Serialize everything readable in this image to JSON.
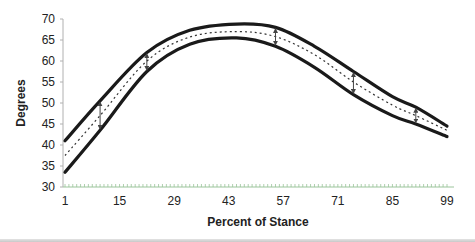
{
  "chart_data": {
    "type": "line",
    "title": "",
    "xlabel": "Percent of Stance",
    "ylabel": "Degrees",
    "xlim": [
      1,
      99
    ],
    "ylim": [
      30,
      70
    ],
    "xticks": [
      1,
      15,
      29,
      43,
      57,
      71,
      85,
      99
    ],
    "yticks": [
      30,
      35,
      40,
      45,
      50,
      55,
      60,
      65,
      70
    ],
    "grid": false,
    "legend": null,
    "x": [
      1,
      10,
      22,
      33,
      45,
      55,
      65,
      75,
      85,
      91,
      99
    ],
    "series": [
      {
        "name": "Upper bound",
        "style": "solid-thick",
        "values": [
          41.0,
          50.5,
          62.0,
          67.3,
          68.8,
          68.0,
          63.5,
          57.5,
          51.5,
          49.0,
          44.5
        ]
      },
      {
        "name": "Mean",
        "style": "dotted",
        "values": [
          37.5,
          47.0,
          60.0,
          65.7,
          67.0,
          65.8,
          61.5,
          55.0,
          49.5,
          47.0,
          43.5
        ]
      },
      {
        "name": "Lower bound",
        "style": "solid-thick",
        "values": [
          33.5,
          43.5,
          57.5,
          64.0,
          65.5,
          63.5,
          58.5,
          52.0,
          47.0,
          45.0,
          42.0
        ]
      }
    ],
    "annotations": [
      {
        "type": "double-arrow",
        "x": 10,
        "from": 43.5,
        "to": 50.5
      },
      {
        "type": "double-arrow",
        "x": 22,
        "from": 57.5,
        "to": 62.0
      },
      {
        "type": "double-arrow",
        "x": 55,
        "from": 63.5,
        "to": 68.0
      },
      {
        "type": "double-arrow",
        "x": 75,
        "from": 52.0,
        "to": 57.5
      },
      {
        "type": "double-arrow",
        "x": 91,
        "from": 45.0,
        "to": 49.0
      }
    ]
  },
  "colors": {
    "curve": "#1a1a1a",
    "mean": "#333333",
    "axis": "#b0b0b0",
    "xticks": "#9bc49b",
    "arrow": "#444444"
  }
}
